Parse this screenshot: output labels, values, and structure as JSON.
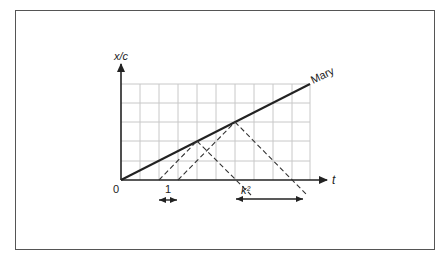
{
  "diagram": {
    "y_axis_label": "x/c",
    "x_axis_label": "t",
    "origin_label": "0",
    "worldline_label": "Mary",
    "interval_label_1": "1",
    "interval_label_k2": "k²",
    "grid": {
      "columns": 10,
      "rows": 5,
      "unit_px": 19
    },
    "worldline_slope": 0.5,
    "signals_emitted_at_t": [
      2,
      3
    ],
    "signals_reflected_at": [
      {
        "t": 4,
        "x": 2
      },
      {
        "t": 6,
        "x": 3
      }
    ],
    "signals_received_at_t": [
      6,
      9
    ],
    "colors": {
      "grid": "#c8c8c8",
      "axis": "#222222",
      "line": "#222222",
      "frame": "#555555"
    }
  }
}
